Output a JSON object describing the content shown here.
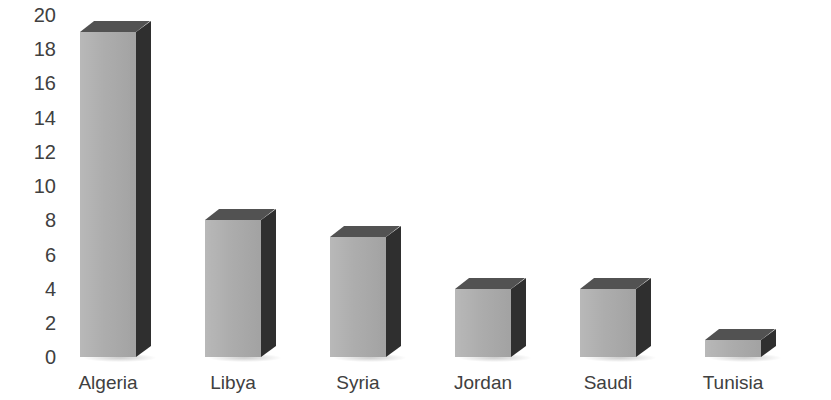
{
  "chart_data": {
    "type": "bar",
    "title": "",
    "subtitle": "",
    "xlabel": "",
    "ylabel": "",
    "categories": [
      "Algeria",
      "Libya",
      "Syria",
      "Jordan",
      "Saudi",
      "Tunisia"
    ],
    "values": [
      19,
      8,
      7,
      4,
      4,
      1
    ],
    "ylim": [
      0,
      20
    ],
    "ytick_labels": [
      "20",
      "18",
      "16",
      "14",
      "12",
      "10",
      "8",
      "6",
      "4",
      "2",
      "0"
    ],
    "ytick_values": [
      20,
      18,
      16,
      14,
      12,
      10,
      8,
      6,
      4,
      2,
      0
    ],
    "grid": false,
    "legend": false,
    "legend_position": "none",
    "style": "3d-column",
    "colors": {
      "bar_front": "#ababab",
      "bar_side": "#2f2f2f",
      "bar_top": "#525252",
      "text": "#404040",
      "background": "#ffffff"
    }
  }
}
